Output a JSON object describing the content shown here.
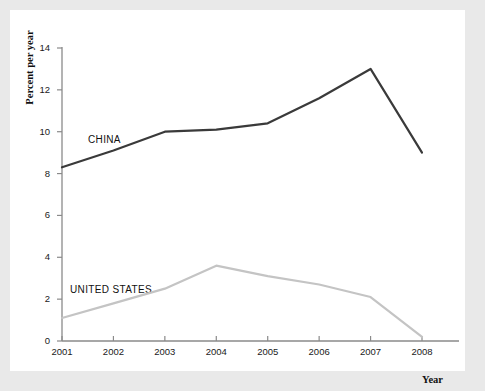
{
  "figure": {
    "background_color": "#e9e9e9",
    "card_color": "#ffffff"
  },
  "axes": {
    "ylabel": "Percent per year",
    "xlabel": "Year",
    "y_ticks": [
      "0",
      "2",
      "4",
      "6",
      "8",
      "10",
      "12",
      "14"
    ],
    "x_ticks": [
      "2001",
      "2002",
      "2003",
      "2004",
      "2005",
      "2006",
      "2007",
      "2008"
    ],
    "axis_color": "#8a8a8a"
  },
  "annotations": {
    "china_label": "CHINA",
    "united_states_label": "UNITED STATES"
  },
  "chart_data": {
    "type": "line",
    "title": "",
    "xlabel": "Year",
    "ylabel": "Percent per year",
    "x": [
      2001,
      2002,
      2003,
      2004,
      2005,
      2006,
      2007,
      2008
    ],
    "xlim": [
      2001,
      2008
    ],
    "ylim": [
      0,
      14
    ],
    "ytick_step": 2,
    "grid": false,
    "legend_position": "inline-annotations",
    "series": [
      {
        "name": "CHINA",
        "color": "#3a3a3a",
        "line_width": 2.2,
        "values": [
          8.3,
          9.1,
          10.0,
          10.1,
          10.4,
          11.6,
          13.0,
          9.0
        ]
      },
      {
        "name": "UNITED STATES",
        "color": "#c4c4c4",
        "line_width": 2.2,
        "values": [
          1.1,
          1.8,
          2.5,
          3.6,
          3.1,
          2.7,
          2.1,
          0.2
        ]
      }
    ]
  }
}
